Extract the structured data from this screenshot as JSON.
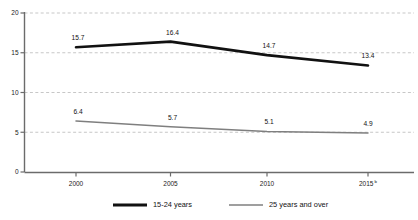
{
  "chart_data": {
    "type": "line",
    "title": "",
    "subtitle": "",
    "xlabel": "",
    "ylabel": "",
    "categories": [
      "2000",
      "2005",
      "2010",
      "2015"
    ],
    "x_tick_labels": [
      "2000",
      "2005",
      "2010",
      "2015"
    ],
    "x_tick_footnotes": [
      "",
      "",
      "",
      "b"
    ],
    "y_tick_labels": [
      "0",
      "5",
      "10",
      "15",
      "20"
    ],
    "y_ticks": [
      0,
      5,
      10,
      15,
      20
    ],
    "ylim": [
      0,
      20
    ],
    "grid": "horizontal-dashed",
    "legend_position": "bottom-center",
    "series": [
      {
        "name": "15-24 years",
        "values": [
          15.7,
          16.4,
          14.7,
          13.4
        ],
        "labels": [
          "15.7",
          "16.4",
          "14.7",
          "13.4"
        ],
        "color": "#111111",
        "line_width": 2.6
      },
      {
        "name": "25 years and over",
        "values": [
          6.4,
          5.7,
          5.1,
          4.9
        ],
        "labels": [
          "6.4",
          "5.7",
          "5.1",
          "4.9"
        ],
        "color": "#7f7f7f",
        "line_width": 1.5
      }
    ]
  },
  "axes": {
    "y_axis_name": "y-axis",
    "x_axis_name": "x-axis"
  },
  "legend": {
    "items": [
      {
        "label": "15-24 years",
        "color": "#111111",
        "line_width": 2.8
      },
      {
        "label": "25 years and over",
        "color": "#7f7f7f",
        "line_width": 1.6
      }
    ]
  },
  "colors": {
    "series_1": "#111111",
    "series_2": "#7f7f7f",
    "gridline": "#b9b9b9",
    "axis": "#6b6b6b",
    "background": "#ffffff"
  }
}
